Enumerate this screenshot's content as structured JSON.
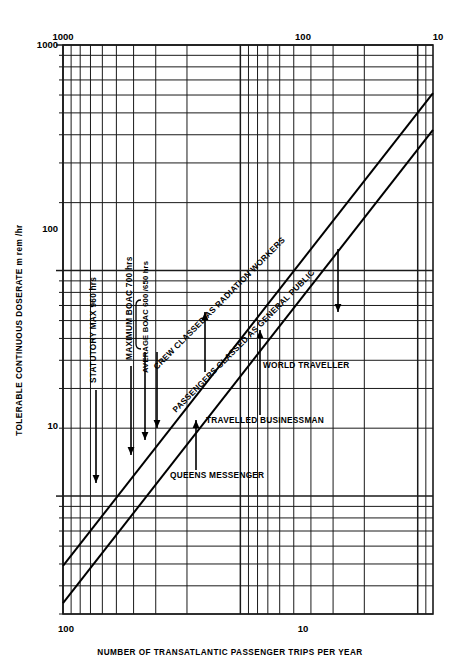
{
  "chart_data": {
    "type": "line",
    "title": "",
    "xlabel": "NUMBER OF TRANSATLANTIC PASSENGER TRIPS PER YEAR",
    "ylabel": "TOLERABLE CONTINUOUS DOSERATE m rem /hr",
    "xscale": "log",
    "yscale": "log",
    "x_reversed": true,
    "xlim": [
      1000,
      8.2
    ],
    "ylim": [
      3.0,
      1000
    ],
    "grid": true,
    "legend_position": "none",
    "xticks_top": [
      {
        "value": 1000,
        "label": "1000"
      },
      {
        "value": 100,
        "label": "100"
      },
      {
        "value": 10,
        "label": "10"
      }
    ],
    "xticks_bottom": [
      {
        "value": 100,
        "label": "100"
      },
      {
        "value": 10,
        "label": "10"
      }
    ],
    "yticks": [
      {
        "value": 1000,
        "label": "1000"
      },
      {
        "value": 100,
        "label": "100"
      },
      {
        "value": 10,
        "label": "10"
      }
    ],
    "series": [
      {
        "name": "CREW CLASSED AS RADIATION WORKERS",
        "points": [
          [
            1000,
            4.9
          ],
          [
            8.2,
            612
          ]
        ],
        "label_rotation_deg": -45
      },
      {
        "name": "PASSENGERS CLASSED AS GENERAL PUBLIC",
        "points": [
          [
            1000,
            3.35
          ],
          [
            8.2,
            420
          ]
        ],
        "label_rotation_deg": -45
      }
    ],
    "annotations": [
      {
        "text": "STATUTORY MAX 960 hrs",
        "orientation": "vertical",
        "arrow": "down"
      },
      {
        "text": "MAXIMUM BOAC 700 hrs",
        "orientation": "vertical",
        "arrow": "down"
      },
      {
        "text": "AVERAGE BOAC 600 /650 hrs",
        "orientation": "vertical",
        "arrow": "down",
        "bracket": true
      },
      {
        "text": "WORLD TRAVELLER",
        "orientation": "horizontal",
        "arrow": "up"
      },
      {
        "text": "TRAVELLED BUSINESSMAN",
        "orientation": "horizontal",
        "arrow": "up"
      },
      {
        "text": "QUEENS MESSENGER",
        "orientation": "horizontal",
        "arrow": "up"
      }
    ]
  },
  "axes": {
    "x_axis_label": "NUMBER OF TRANSATLANTIC PASSENGER TRIPS PER YEAR",
    "y_axis_label": "TOLERABLE CONTINUOUS DOSERATE m rem /hr",
    "top_tick_1000": "1000",
    "top_tick_100": "100",
    "top_tick_10": "10",
    "bottom_tick_100": "100",
    "bottom_tick_10": "10",
    "left_tick_1000": "1000",
    "left_tick_100": "100",
    "left_tick_10": "10"
  },
  "labels": {
    "crew_line": "CREW CLASSED AS RADIATION WORKERS",
    "public_line": "PASSENGERS CLASSED AS GENERAL PUBLIC",
    "statutory_max": "STATUTORY MAX 960 hrs",
    "max_boac": "MAXIMUM BOAC 700 hrs",
    "avg_boac": "AVERAGE BOAC 600 /650 hrs",
    "world_traveller": "WORLD TRAVELLER",
    "travelled_businessman": "TRAVELLED BUSINESSMAN",
    "queens_messenger": "QUEENS MESSENGER"
  },
  "colors": {
    "background": "#ffffff",
    "ink": "#000000",
    "grid": "#1a1a1a"
  }
}
